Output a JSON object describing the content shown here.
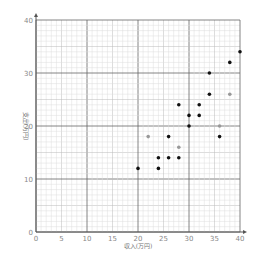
{
  "chart_data": {
    "type": "scatter",
    "title": "",
    "xlabel": "収入(万円)",
    "ylabel": "支出(万円)",
    "xlim": [
      0,
      40
    ],
    "ylim": [
      0,
      40
    ],
    "grid": true,
    "x_ticks": [
      0,
      5,
      10,
      15,
      20,
      25,
      30,
      35,
      40
    ],
    "y_ticks": [
      0,
      10,
      20,
      30,
      40
    ],
    "series": [
      {
        "name": "black",
        "color": "#111111",
        "points": [
          [
            20,
            12
          ],
          [
            24,
            12
          ],
          [
            24,
            14
          ],
          [
            26,
            14
          ],
          [
            28,
            14
          ],
          [
            26,
            18
          ],
          [
            36,
            18
          ],
          [
            30,
            20
          ],
          [
            30,
            22
          ],
          [
            32,
            22
          ],
          [
            28,
            24
          ],
          [
            32,
            24
          ],
          [
            34,
            26
          ],
          [
            34,
            30
          ],
          [
            38,
            32
          ],
          [
            40,
            34
          ]
        ]
      },
      {
        "name": "gray",
        "color": "#999999",
        "points": [
          [
            22,
            18
          ],
          [
            28,
            16
          ],
          [
            36,
            20
          ],
          [
            38,
            26
          ]
        ]
      }
    ]
  }
}
